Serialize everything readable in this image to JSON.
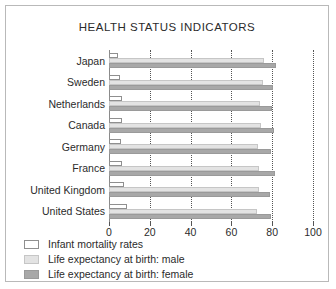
{
  "chart_data": {
    "type": "bar",
    "orientation": "horizontal",
    "title": "HEALTH STATUS INDICATORS",
    "xlabel": "",
    "ylabel": "",
    "xlim": [
      0,
      100
    ],
    "xticks": [
      0,
      20,
      40,
      60,
      80,
      100
    ],
    "xtick_labels": [
      "0",
      "20",
      "40",
      "60",
      "80",
      "100"
    ],
    "grid": "vertical-dotted",
    "legend_position": "below-left",
    "categories": [
      "Japan",
      "Sweden",
      "Netherlands",
      "Canada",
      "Germany",
      "France",
      "United Kingdom",
      "United States"
    ],
    "series": [
      {
        "name": "Infant mortality rates",
        "color": "#ffffff",
        "edge_color": "#8f8f8f",
        "values": [
          4.5,
          5.5,
          6.5,
          6.5,
          6.0,
          6.5,
          7.5,
          9.0
        ]
      },
      {
        "name": "Life expectancy at birth: male",
        "color": "#e3e3e3",
        "edge_color": "#c6c6c6",
        "values": [
          76.0,
          75.5,
          74.0,
          74.5,
          73.0,
          73.5,
          73.5,
          72.5
        ]
      },
      {
        "name": "Life expectancy at birth: female",
        "color": "#a8a8a8",
        "edge_color": "#9a9a9a",
        "values": [
          82.0,
          80.5,
          80.0,
          81.0,
          79.5,
          81.5,
          79.0,
          79.5
        ]
      }
    ]
  },
  "legend": {
    "items": [
      "Infant mortality rates",
      "Life expectancy at birth: male",
      "Life expectancy at birth: female"
    ]
  }
}
